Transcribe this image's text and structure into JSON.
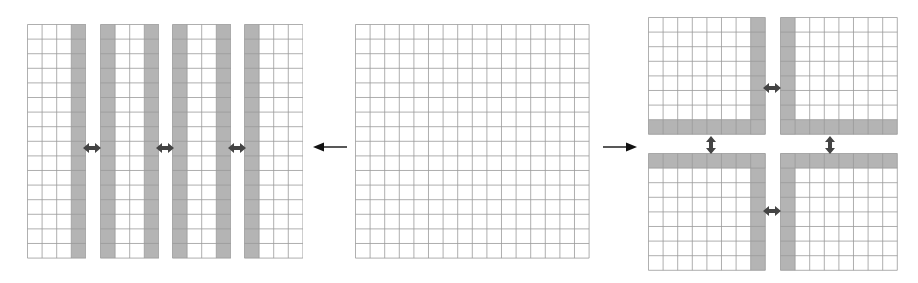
{
  "figure": {
    "colors": {
      "grid_line": "#9a9a9a",
      "halo_fill": "#b4b4b4",
      "background": "#ffffff",
      "arrow": "#111111",
      "exchange_arrow": "#444444"
    },
    "cell_size": 14.6
  },
  "center_grid": {
    "label": "original-domain",
    "x": 355,
    "y": 24,
    "cols": 16,
    "rows": 16,
    "halo_cols": [],
    "halo_rows": []
  },
  "left_arrow": {
    "direction": "left",
    "x1": 347,
    "x2": 313,
    "y": 144
  },
  "right_arrow": {
    "direction": "right",
    "x1": 603,
    "x2": 637,
    "y": 144
  },
  "strip_decomposition": {
    "subgrids": [
      {
        "name": "strip-1",
        "x": 27,
        "y": 24,
        "cols": 4,
        "rows": 16,
        "halo_cols": [
          3
        ],
        "halo_rows": []
      },
      {
        "name": "strip-2",
        "x": 100,
        "y": 24,
        "cols": 4,
        "rows": 16,
        "halo_cols": [
          0,
          3
        ],
        "halo_rows": []
      },
      {
        "name": "strip-3",
        "x": 172,
        "y": 24,
        "cols": 4,
        "rows": 16,
        "halo_cols": [
          0,
          3
        ],
        "halo_rows": []
      },
      {
        "name": "strip-4",
        "x": 244,
        "y": 24,
        "cols": 4,
        "rows": 16,
        "halo_cols": [
          0
        ],
        "halo_rows": []
      }
    ],
    "exchange_arrows": [
      {
        "orientation": "horizontal",
        "cx": 92,
        "cy": 143
      },
      {
        "orientation": "horizontal",
        "cx": 165,
        "cy": 143
      },
      {
        "orientation": "horizontal",
        "cx": 237,
        "cy": 143
      }
    ]
  },
  "quadrant_decomposition": {
    "subgrids": [
      {
        "name": "quadrant-top-left",
        "x": 648,
        "y": 17,
        "cols": 8,
        "rows": 8,
        "halo_cols": [
          7
        ],
        "halo_rows": [
          7
        ]
      },
      {
        "name": "quadrant-top-right",
        "x": 780,
        "y": 17,
        "cols": 8,
        "rows": 8,
        "halo_cols": [
          0
        ],
        "halo_rows": [
          7
        ]
      },
      {
        "name": "quadrant-bottom-left",
        "x": 648,
        "y": 153,
        "cols": 8,
        "rows": 8,
        "halo_cols": [
          7
        ],
        "halo_rows": [
          0
        ]
      },
      {
        "name": "quadrant-bottom-right",
        "x": 780,
        "y": 153,
        "cols": 8,
        "rows": 8,
        "halo_cols": [
          0
        ],
        "halo_rows": [
          0
        ]
      }
    ],
    "exchange_arrows": [
      {
        "orientation": "horizontal",
        "cx": 772,
        "cy": 83
      },
      {
        "orientation": "horizontal",
        "cx": 772,
        "cy": 206
      },
      {
        "orientation": "vertical",
        "cx": 711,
        "cy": 145
      },
      {
        "orientation": "vertical",
        "cx": 830,
        "cy": 145
      }
    ]
  }
}
